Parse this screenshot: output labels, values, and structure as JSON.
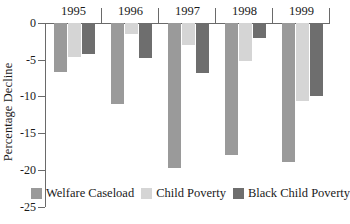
{
  "chart_data": {
    "type": "bar",
    "title": "",
    "subtitle": "",
    "xlabel": "",
    "ylabel": "Percentage Decline",
    "categories": [
      "1995",
      "1996",
      "1997",
      "1998",
      "1999"
    ],
    "series": [
      {
        "name": "Welfare Caseload",
        "color": "#9a9a9a",
        "values": [
          -6.7,
          -11.1,
          -19.7,
          -18.0,
          -19.0
        ]
      },
      {
        "name": "Child Poverty",
        "color": "#d5d5d5",
        "values": [
          -4.7,
          -1.5,
          -3.0,
          -5.2,
          -10.6
        ]
      },
      {
        "name": "Black Child Poverty",
        "color": "#6e6e6e",
        "values": [
          -4.2,
          -4.8,
          -6.8,
          -2.0,
          -10.0
        ]
      }
    ],
    "ylim": [
      -25,
      0
    ],
    "yticks": [
      0,
      -5,
      -10,
      -15,
      -20,
      -25
    ],
    "ytick_labels": [
      "0",
      "-5",
      "-10",
      "-15",
      "-20",
      "-25"
    ],
    "grid": false,
    "legend_position": "bottom-center",
    "axis_color": "#6a6a6a",
    "background": "#ffffff",
    "x_axis_position": "top"
  }
}
